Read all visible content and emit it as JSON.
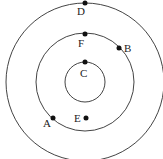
{
  "diagram": {
    "type": "concentric-circles",
    "center": [
      85,
      82
    ],
    "circles": [
      {
        "name": "inner",
        "r": 20
      },
      {
        "name": "middle",
        "r": 49
      },
      {
        "name": "outer",
        "r": 79
      }
    ],
    "points": [
      {
        "label": "D",
        "x": 85,
        "y": 3,
        "lx": 78,
        "ly": 15
      },
      {
        "label": "F",
        "x": 85,
        "y": 34,
        "lx": 78,
        "ly": 48
      },
      {
        "label": "B",
        "x": 119,
        "y": 48,
        "lx": 124,
        "ly": 52
      },
      {
        "label": "C",
        "x": 85,
        "y": 62,
        "lx": 80,
        "ly": 78
      },
      {
        "label": "A",
        "x": 53,
        "y": 118,
        "lx": 43,
        "ly": 126
      },
      {
        "label": "E",
        "x": 86,
        "y": 118,
        "lx": 74,
        "ly": 122
      }
    ]
  },
  "labels": {
    "A": "A",
    "B": "B",
    "C": "C",
    "D": "D",
    "E": "E",
    "F": "F"
  }
}
